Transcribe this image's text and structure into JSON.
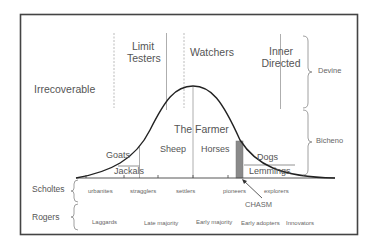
{
  "diagram": {
    "segments_top": [
      {
        "label": "Irrecoverable"
      },
      {
        "label": "Limit\nTesters",
        "line1": "Limit",
        "line2": "Testers"
      },
      {
        "label": "Watchers"
      },
      {
        "label": "Inner\nDirected",
        "line1": "Inner",
        "line2": "Directed"
      }
    ],
    "right_braces": [
      {
        "label": "Devine"
      },
      {
        "label": "Bicheno"
      }
    ],
    "curve_title": "The Farmer",
    "curve_segments": [
      {
        "label": "Goats"
      },
      {
        "label": "Jackals"
      },
      {
        "label": "Sheep"
      },
      {
        "label": "Horses"
      },
      {
        "label": "Dogs"
      },
      {
        "label": "Lemmings"
      }
    ],
    "chasm": {
      "label": "CHASM",
      "color": "#8a8a8a"
    },
    "scholtes": {
      "label": "Scholtes",
      "categories": [
        "urbanites",
        "stragglers",
        "settlers",
        "pioneers",
        "explorers"
      ]
    },
    "rogers": {
      "label": "Rogers",
      "categories": [
        "Laggards",
        "Late majority",
        "Early majority",
        "Early adopters",
        "Innovators"
      ]
    },
    "colors": {
      "frame": "#444444",
      "curve": "#222222",
      "divider": "#999999",
      "text": "#555555"
    }
  }
}
